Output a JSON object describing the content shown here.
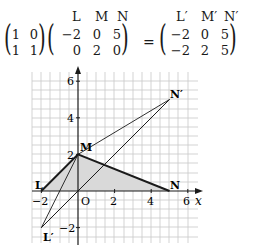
{
  "equation": {
    "transform_matrix": [
      [
        "1",
        "0"
      ],
      [
        "1",
        "1"
      ]
    ],
    "original_labels": [
      "L",
      "M",
      "N"
    ],
    "original_matrix": [
      [
        "−2",
        "0",
        "5"
      ],
      [
        "0",
        "2",
        "0"
      ]
    ],
    "equals": "=",
    "image_labels": [
      "L′",
      "M′",
      "N′"
    ],
    "image_matrix": [
      [
        "−2",
        "0",
        "5"
      ],
      [
        "−2",
        "2",
        "5"
      ]
    ]
  },
  "graph": {
    "x_axis_label": "x",
    "x_ticks": [
      "−2",
      "2",
      "4",
      "6"
    ],
    "y_ticks": [
      "6",
      "4",
      "2",
      "−2"
    ],
    "origin_label": "O",
    "points": {
      "L": {
        "label": "L",
        "x": -2,
        "y": 0
      },
      "M": {
        "label": "M",
        "x": 0,
        "y": 2
      },
      "N": {
        "label": "N",
        "x": 5,
        "y": 0
      },
      "L_prime": {
        "label": "L′",
        "x": -2,
        "y": -2
      },
      "N_prime": {
        "label": "N′",
        "x": 5,
        "y": 5
      }
    },
    "colors": {
      "grid": "#c8c8c8",
      "axis": "#1a1a1a",
      "fill": "#d9d9d9",
      "line": "#1a1a1a"
    }
  }
}
